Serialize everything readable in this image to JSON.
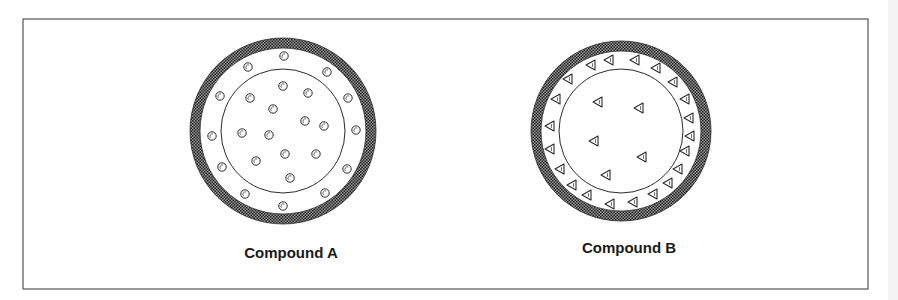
{
  "figure": {
    "frame": {
      "x": 23,
      "y": 19,
      "width": 845,
      "height": 270,
      "stroke": "#555555"
    },
    "colors": {
      "ring_dark": "#1e1e1e",
      "ring_light": "#9a9a9a",
      "line": "#2a2a2a",
      "background": "#ffffff"
    },
    "compounds": [
      {
        "label": "Compound A",
        "label_pos": {
          "x": 291,
          "y": 244
        },
        "center": {
          "x": 283,
          "y": 131
        },
        "outer_radius": 93,
        "ring_width": 10,
        "inner_radius": 62,
        "particle_shape": "circle",
        "particles_outer_shell": [
          [
            284,
            56
          ],
          [
            248,
            67
          ],
          [
            327,
            72
          ],
          [
            220,
            96
          ],
          [
            348,
            98
          ],
          [
            212,
            136
          ],
          [
            356,
            130
          ],
          [
            222,
            167
          ],
          [
            347,
            169
          ],
          [
            245,
            194
          ],
          [
            325,
            193
          ],
          [
            283,
            206
          ]
        ],
        "particles_core": [
          [
            283,
            86
          ],
          [
            308,
            93
          ],
          [
            250,
            98
          ],
          [
            273,
            109
          ],
          [
            305,
            121
          ],
          [
            324,
            126
          ],
          [
            242,
            133
          ],
          [
            269,
            135
          ],
          [
            285,
            154
          ],
          [
            316,
            154
          ],
          [
            256,
            161
          ],
          [
            290,
            178
          ]
        ]
      },
      {
        "label": "Compound B",
        "label_pos": {
          "x": 629,
          "y": 239
        },
        "center": {
          "x": 621,
          "y": 131
        },
        "outer_radius": 90,
        "ring_width": 10,
        "inner_radius": 62,
        "particle_shape": "triangle-left",
        "particles_outer_shell": [
          [
            591,
            65
          ],
          [
            609,
            60
          ],
          [
            635,
            60
          ],
          [
            656,
            68
          ],
          [
            568,
            79
          ],
          [
            673,
            82
          ],
          [
            556,
            99
          ],
          [
            685,
            99
          ],
          [
            550,
            126
          ],
          [
            689,
            118
          ],
          [
            690,
            136
          ],
          [
            550,
            149
          ],
          [
            685,
            151
          ],
          [
            560,
            169
          ],
          [
            678,
            169
          ],
          [
            572,
            185
          ],
          [
            668,
            183
          ],
          [
            587,
            195
          ],
          [
            653,
            194
          ],
          [
            610,
            204
          ],
          [
            633,
            202
          ]
        ],
        "particles_core": [
          [
            598,
            102
          ],
          [
            639,
            108
          ],
          [
            594,
            141
          ],
          [
            642,
            157
          ],
          [
            606,
            175
          ]
        ]
      }
    ]
  }
}
